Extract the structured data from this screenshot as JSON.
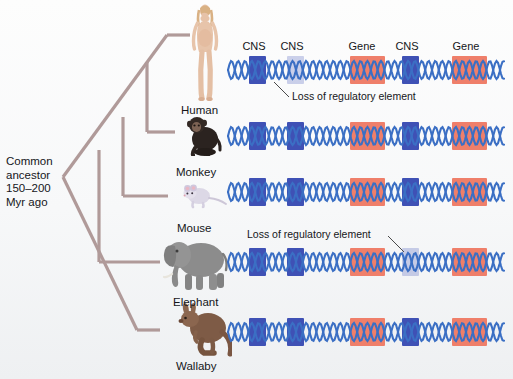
{
  "figure": {
    "type": "phylogenetic-tree-with-genomic-alignment",
    "ancestor_label": "Common\nancestor\n150–200\nMyr ago",
    "ancestor_lines": [
      "Common",
      "ancestor",
      "150–200",
      "Myr ago"
    ]
  },
  "element_headers": [
    {
      "label": "CNS",
      "x": 253
    },
    {
      "label": "CNS",
      "x": 291
    },
    {
      "label": "Gene",
      "x": 361
    },
    {
      "label": "CNS",
      "x": 406
    },
    {
      "label": "Gene",
      "x": 466
    }
  ],
  "annotations": [
    {
      "text": "Loss of regulatory element",
      "x": 291,
      "y": 90,
      "leader_from": [
        289,
        97
      ],
      "leader_to": [
        272,
        80
      ]
    },
    {
      "text": "Loss of regulatory element",
      "x": 247,
      "y": 228,
      "leader_from": [
        388,
        236
      ],
      "leader_to": [
        404,
        252
      ]
    }
  ],
  "species": [
    {
      "name": "Human",
      "label_x": 181,
      "label_y": 104,
      "icon": "human-figure",
      "dna_y": 56,
      "elements": [
        {
          "kind": "cns",
          "x": 249,
          "w": 17,
          "state": "present"
        },
        {
          "kind": "cns",
          "x": 287,
          "w": 17,
          "state": "lost"
        },
        {
          "kind": "gene",
          "x": 350,
          "w": 35,
          "state": "present"
        },
        {
          "kind": "cns",
          "x": 402,
          "w": 17,
          "state": "present"
        },
        {
          "kind": "gene",
          "x": 452,
          "w": 35,
          "state": "present"
        }
      ]
    },
    {
      "name": "Monkey",
      "label_x": 176,
      "label_y": 166,
      "icon": "monkey-figure",
      "dna_y": 122,
      "elements": [
        {
          "kind": "cns",
          "x": 249,
          "w": 17,
          "state": "present"
        },
        {
          "kind": "cns",
          "x": 287,
          "w": 17,
          "state": "present"
        },
        {
          "kind": "gene",
          "x": 350,
          "w": 35,
          "state": "present"
        },
        {
          "kind": "cns",
          "x": 402,
          "w": 17,
          "state": "present"
        },
        {
          "kind": "gene",
          "x": 452,
          "w": 35,
          "state": "present"
        }
      ]
    },
    {
      "name": "Mouse",
      "label_x": 177,
      "label_y": 222,
      "icon": "mouse-figure",
      "dna_y": 178,
      "elements": [
        {
          "kind": "cns",
          "x": 249,
          "w": 17,
          "state": "present"
        },
        {
          "kind": "cns",
          "x": 287,
          "w": 17,
          "state": "present"
        },
        {
          "kind": "gene",
          "x": 350,
          "w": 35,
          "state": "present"
        },
        {
          "kind": "cns",
          "x": 402,
          "w": 17,
          "state": "present"
        },
        {
          "kind": "gene",
          "x": 452,
          "w": 35,
          "state": "present"
        }
      ]
    },
    {
      "name": "Elephant",
      "label_x": 173,
      "label_y": 296,
      "icon": "elephant-figure",
      "dna_y": 248,
      "elements": [
        {
          "kind": "cns",
          "x": 249,
          "w": 17,
          "state": "present"
        },
        {
          "kind": "cns",
          "x": 287,
          "w": 17,
          "state": "present"
        },
        {
          "kind": "gene",
          "x": 350,
          "w": 35,
          "state": "present"
        },
        {
          "kind": "cns",
          "x": 402,
          "w": 17,
          "state": "lost"
        },
        {
          "kind": "gene",
          "x": 452,
          "w": 35,
          "state": "present"
        }
      ]
    },
    {
      "name": "Wallaby",
      "label_x": 176,
      "label_y": 364,
      "icon": "wallaby-figure",
      "dna_y": 318,
      "elements": [
        {
          "kind": "cns",
          "x": 249,
          "w": 17,
          "state": "present"
        },
        {
          "kind": "cns",
          "x": 287,
          "w": 17,
          "state": "present"
        },
        {
          "kind": "gene",
          "x": 350,
          "w": 35,
          "state": "present"
        },
        {
          "kind": "cns",
          "x": 402,
          "w": 17,
          "state": "present"
        },
        {
          "kind": "gene",
          "x": 452,
          "w": 35,
          "state": "present"
        }
      ]
    }
  ],
  "colors": {
    "cns": "#3f51b5",
    "gene": "#ef7f6a",
    "dna_strand": "#3b6fc4",
    "tree_branch": "#b09a99",
    "text": "#15161a"
  }
}
